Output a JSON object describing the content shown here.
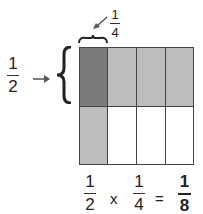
{
  "diagram": {
    "left_fraction": {
      "numerator": "1",
      "denominator": "2"
    },
    "top_fraction": {
      "numerator": "1",
      "denominator": "4"
    },
    "equation": {
      "a": {
        "numerator": "1",
        "denominator": "2"
      },
      "op": "x",
      "b": {
        "numerator": "1",
        "denominator": "4"
      },
      "eq": "=",
      "result": {
        "numerator": "1",
        "denominator": "8"
      }
    },
    "grid": {
      "rows": 2,
      "cols": 4,
      "colors": {
        "overlap": "#7a7a7a",
        "row_shade": "#bdbdbd",
        "col_shade": "#bdbdbd",
        "empty": "#ffffff"
      }
    }
  }
}
